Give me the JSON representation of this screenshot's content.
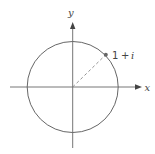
{
  "diagram": {
    "title": "",
    "axes": {
      "x_label": "x",
      "y_label": "y"
    },
    "circle": {
      "center": [
        0,
        0
      ],
      "radius": 1.414
    },
    "point": {
      "label_parts": [
        "1",
        "+",
        "i"
      ],
      "label": "1 + i",
      "coords": [
        1,
        1
      ]
    },
    "colors": {
      "line": "#555555",
      "dashed": "#888888",
      "point": "#666666",
      "text": "#444444"
    }
  }
}
